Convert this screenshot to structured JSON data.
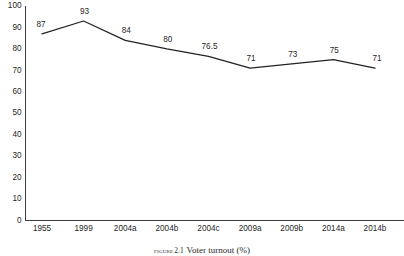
{
  "chart_data": {
    "type": "line",
    "title": "",
    "categories": [
      "1955",
      "1999",
      "2004a",
      "2004b",
      "2004c",
      "2009a",
      "2009b",
      "2014a",
      "2014b"
    ],
    "values": [
      87,
      93,
      84,
      80,
      76.5,
      71,
      73,
      75,
      71
    ],
    "point_labels": [
      "87",
      "93",
      "84",
      "80",
      "76.5",
      "71",
      "73",
      "75",
      "71"
    ],
    "xlabel": "",
    "ylabel": "",
    "ylim": [
      0,
      100
    ],
    "y_ticks": [
      0,
      10,
      20,
      30,
      40,
      50,
      60,
      70,
      80,
      90,
      100
    ],
    "y_tick_labels": [
      "0",
      "10",
      "20",
      "30",
      "40",
      "50",
      "60",
      "70",
      "80",
      "90",
      "100"
    ],
    "grid": false,
    "legend": "none",
    "series": [
      {
        "name": "Voter turnout (%)",
        "values": [
          87,
          93,
          84,
          80,
          76.5,
          71,
          73,
          75,
          71
        ],
        "color": "#222222"
      }
    ],
    "colors": {
      "line": "#222222",
      "axis": "#3b3b3b",
      "text": "#1f1f1f",
      "background": "#ffffff"
    }
  },
  "caption": {
    "lead": "FIGURE",
    "number": "2.1",
    "text": "Voter turnout (%)"
  }
}
